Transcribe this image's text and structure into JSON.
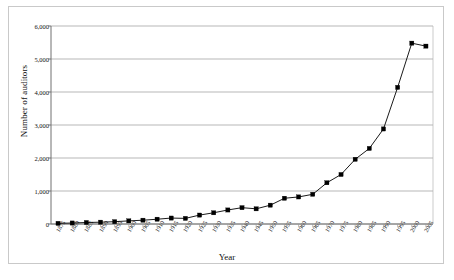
{
  "chart_data": {
    "type": "line",
    "title": "",
    "xlabel": "Year",
    "ylabel": "Number of auditors",
    "ylim": [
      0,
      6000
    ],
    "ytick_labels": [
      "0",
      "1,000",
      "2,000",
      "3,000",
      "4,000",
      "5,000",
      "6,000"
    ],
    "ytick_values": [
      0,
      1000,
      2000,
      3000,
      4000,
      5000,
      6000
    ],
    "grid": true,
    "legend": "none",
    "marker": "filled-square",
    "line_color": "#000000",
    "marker_color": "#000000",
    "grid_color": "#9a9a9a",
    "categories": [
      "1875",
      "1880",
      "1885",
      "1890",
      "1895",
      "1900",
      "1905",
      "1910",
      "1915",
      "1920",
      "1925",
      "1930",
      "1935",
      "1940",
      "1945",
      "1950",
      "1955",
      "1960",
      "1965",
      "1970",
      "1975",
      "1980",
      "1985",
      "1990",
      "1995",
      "2000",
      "2005"
    ],
    "values": [
      20,
      30,
      45,
      55,
      70,
      95,
      115,
      145,
      180,
      170,
      270,
      340,
      425,
      495,
      460,
      570,
      780,
      820,
      900,
      1250,
      1500,
      1960,
      2290,
      2880,
      4140,
      5480,
      5390
    ]
  },
  "axes": {
    "x_title": "Year",
    "y_title": "Number of auditors"
  }
}
